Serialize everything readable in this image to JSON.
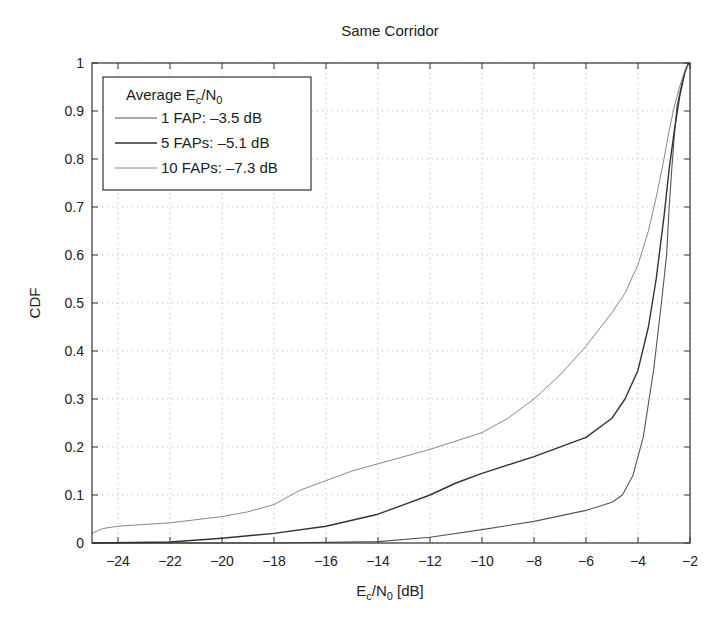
{
  "chart_data": {
    "type": "line",
    "title": "Same Corridor",
    "xlabel": "E_c/N_0 [dB]",
    "ylabel": "CDF",
    "xlim": [
      -25,
      -2
    ],
    "ylim": [
      0,
      1
    ],
    "xticks": [
      -24,
      -22,
      -20,
      -18,
      -16,
      -14,
      -12,
      -10,
      -8,
      -6,
      -4,
      -2
    ],
    "yticks": [
      0,
      0.1,
      0.2,
      0.3,
      0.4,
      0.5,
      0.6,
      0.7,
      0.8,
      0.9,
      1
    ],
    "grid": true,
    "legend": {
      "title": "Average E_c/N_0",
      "position": "upper left",
      "entries": [
        "1 FAP: -3.5 dB",
        "5 FAPs: -5.1 dB",
        "10 FAPs: -7.3 dB"
      ]
    },
    "series": [
      {
        "name": "1 FAP: -3.5 dB",
        "color": "#555555",
        "width": 1.1,
        "x": [
          -25,
          -18,
          -14,
          -12,
          -10,
          -8,
          -6,
          -5,
          -4.6,
          -4.2,
          -3.8,
          -3.4,
          -3.1,
          -2.9,
          -2.8,
          -2.7,
          -2.6,
          -2.5,
          -2.3,
          -2.15,
          -2.05
        ],
        "y": [
          0,
          0,
          0.003,
          0.012,
          0.028,
          0.045,
          0.068,
          0.085,
          0.1,
          0.14,
          0.22,
          0.36,
          0.5,
          0.6,
          0.7,
          0.78,
          0.85,
          0.91,
          0.96,
          0.99,
          1.0
        ]
      },
      {
        "name": "5 FAPs: -5.1 dB",
        "color": "#333333",
        "width": 1.4,
        "x": [
          -25,
          -22,
          -20,
          -18,
          -16,
          -14,
          -13,
          -12,
          -11,
          -10,
          -8,
          -6,
          -5,
          -4.5,
          -4,
          -3.6,
          -3.3,
          -3.0,
          -2.8,
          -2.6,
          -2.4,
          -2.2,
          -2.05
        ],
        "y": [
          0,
          0.002,
          0.01,
          0.02,
          0.035,
          0.06,
          0.08,
          0.1,
          0.125,
          0.145,
          0.18,
          0.22,
          0.26,
          0.3,
          0.36,
          0.45,
          0.55,
          0.68,
          0.78,
          0.86,
          0.93,
          0.98,
          1.0
        ]
      },
      {
        "name": "10 FAPs: -7.3 dB",
        "color": "#888888",
        "width": 1.0,
        "x": [
          -25,
          -24.6,
          -24,
          -22,
          -20,
          -19,
          -18,
          -17,
          -16,
          -15,
          -14,
          -12,
          -10,
          -9,
          -8,
          -7,
          -6,
          -5,
          -4.5,
          -4,
          -3.6,
          -3.3,
          -3.0,
          -2.8,
          -2.6,
          -2.4,
          -2.2,
          -2.0
        ],
        "y": [
          0.02,
          0.03,
          0.035,
          0.042,
          0.055,
          0.065,
          0.08,
          0.11,
          0.13,
          0.15,
          0.165,
          0.195,
          0.23,
          0.26,
          0.3,
          0.35,
          0.41,
          0.48,
          0.52,
          0.58,
          0.65,
          0.72,
          0.8,
          0.86,
          0.91,
          0.95,
          0.985,
          1.0
        ]
      }
    ]
  }
}
